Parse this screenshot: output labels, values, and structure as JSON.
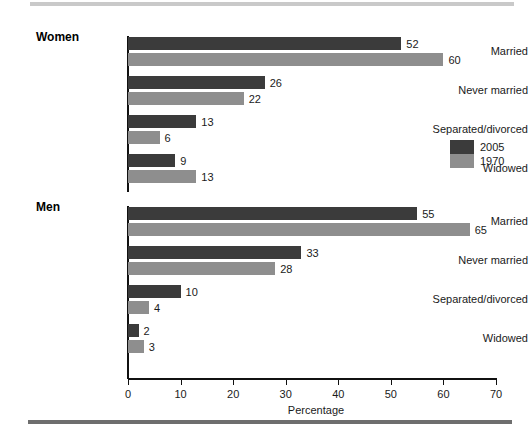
{
  "chart_data": {
    "type": "bar",
    "orientation": "horizontal",
    "title": "",
    "xlabel": "Percentage",
    "ylabel": "",
    "xlim": [
      0,
      70
    ],
    "xticks": [
      0,
      10,
      20,
      30,
      40,
      50,
      60,
      70
    ],
    "grid": false,
    "legend_position": "right",
    "legend": [
      "2005",
      "1970"
    ],
    "series": [
      {
        "name": "2005",
        "color": "#3b3b3b"
      },
      {
        "name": "1970",
        "color": "#8e8e8e"
      }
    ],
    "panels": [
      {
        "name": "Women",
        "categories": [
          "Married",
          "Never married",
          "Separated/divorced",
          "Widowed"
        ],
        "series": [
          {
            "name": "2005",
            "values": [
              52,
              26,
              13,
              9
            ]
          },
          {
            "name": "1970",
            "values": [
              60,
              22,
              6,
              13
            ]
          }
        ]
      },
      {
        "name": "Men",
        "categories": [
          "Married",
          "Never married",
          "Separated/divorced",
          "Widowed"
        ],
        "series": [
          {
            "name": "2005",
            "values": [
              55,
              33,
              10,
              2
            ]
          },
          {
            "name": "1970",
            "values": [
              65,
              28,
              4,
              3
            ]
          }
        ]
      }
    ]
  },
  "panels": {
    "women": {
      "title": "Women",
      "rows": [
        {
          "label": "Married",
          "v2005": "52",
          "v1970": "60"
        },
        {
          "label": "Never married",
          "v2005": "26",
          "v1970": "22"
        },
        {
          "label": "Separated/divorced",
          "v2005": "13",
          "v1970": "6"
        },
        {
          "label": "Widowed",
          "v2005": "9",
          "v1970": "13"
        }
      ]
    },
    "men": {
      "title": "Men",
      "rows": [
        {
          "label": "Married",
          "v2005": "55",
          "v1970": "65"
        },
        {
          "label": "Never married",
          "v2005": "33",
          "v1970": "28"
        },
        {
          "label": "Separated/divorced",
          "v2005": "10",
          "v1970": "4"
        },
        {
          "label": "Widowed",
          "v2005": "2",
          "v1970": "3"
        }
      ]
    }
  },
  "axis": {
    "title": "Percentage",
    "ticks": [
      "0",
      "10",
      "20",
      "30",
      "40",
      "50",
      "60",
      "70"
    ]
  },
  "legend": {
    "items": [
      {
        "label": "2005",
        "color": "#3b3b3b"
      },
      {
        "label": "1970",
        "color": "#8e8e8e"
      }
    ]
  },
  "colors": {
    "series_2005": "#3b3b3b",
    "series_1970": "#8e8e8e",
    "axis": "#111111",
    "rule_top": "#c9c9c9",
    "rule_bottom": "#6e6e6e"
  }
}
